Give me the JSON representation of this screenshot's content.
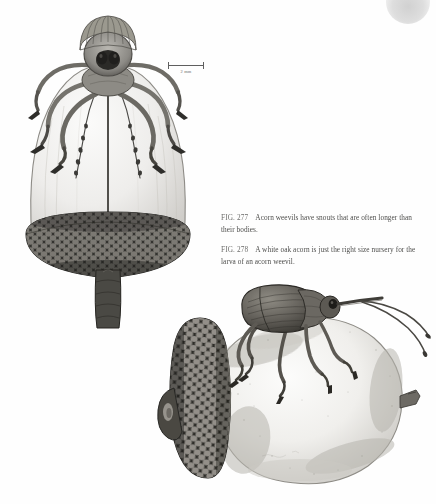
{
  "page": {
    "background_color": "#fefefe",
    "ink_color": "#3a3a3a",
    "type": "book-page-scan"
  },
  "scale_bar": {
    "label": "2 mm",
    "name": "scale-bar"
  },
  "captions": [
    {
      "figure_number": "FIG. 277",
      "text": "Acorn weevils have snouts that are often longer than their bodies."
    },
    {
      "figure_number": "FIG. 278",
      "text": "A white oak acorn is just the right size nursery for the larva of an acorn weevil."
    }
  ],
  "figures": [
    {
      "id": "fig-277",
      "title": "Acorn weevil dorsal view on acorn",
      "subject": "acorn weevil",
      "view": "dorsal",
      "elements": [
        "weevil-head",
        "weevil-rostrum",
        "weevil-antennae",
        "weevil-legs",
        "acorn-nut",
        "acorn-cap",
        "acorn-stem"
      ],
      "medium": "pen-and-ink stipple drawing"
    },
    {
      "id": "fig-278",
      "title": "Acorn weevil standing on white oak acorn",
      "subject": "white oak acorn with acorn weevil",
      "view": "lateral",
      "elements": [
        "weevil-body",
        "weevil-elytra",
        "weevil-rostrum",
        "weevil-antennae",
        "weevil-legs",
        "acorn-nut",
        "acorn-cap",
        "acorn-tip"
      ],
      "medium": "pen-and-ink stipple drawing"
    }
  ],
  "corner_mark": {
    "name": "gray-blob",
    "color": "#d0d0d0"
  }
}
